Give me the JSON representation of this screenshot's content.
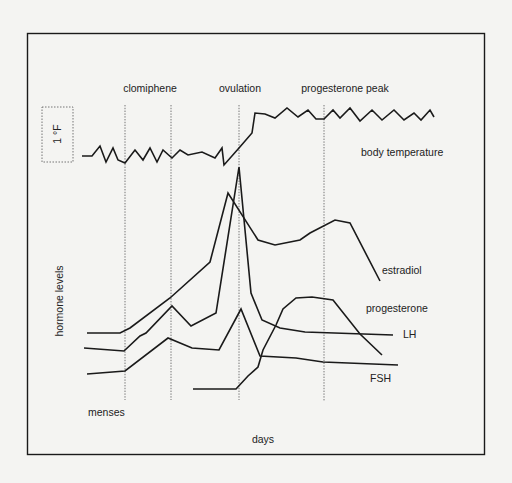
{
  "figure": {
    "title": "",
    "x_axis_label": "days",
    "y_axis_label": "hormone levels",
    "start_marker_label": "menses",
    "temperature_scale_label": "1 °F",
    "events": [
      {
        "label": "clomiphene",
        "lines_x": [
          125,
          172
        ]
      },
      {
        "label": "ovulation",
        "lines_x": [
          239
        ]
      },
      {
        "label": "progesterone peak",
        "lines_x": [
          324
        ]
      }
    ],
    "series_labels": {
      "body_temperature": "body temperature",
      "estradiol": "estradiol",
      "progesterone": "progesterone",
      "lh": "LH",
      "fsh": "FSH"
    },
    "colors": {
      "background": "#f4f4f2",
      "line": "#1a1a1a",
      "dashed": "#555555"
    }
  },
  "chart_data": {
    "type": "line",
    "title": "",
    "xlabel": "days",
    "ylabel": "hormone levels",
    "grid": false,
    "legend_position": "inline labels at right end of each curve",
    "annotations": [
      "clomiphene",
      "ovulation",
      "progesterone peak",
      "menses",
      "1 °F",
      "body temperature"
    ],
    "note": "Schematic, unitless curves; points given in image pixel coordinates (x right, y down).",
    "series": [
      {
        "name": "body temperature",
        "points": [
          [
            82,
            156
          ],
          [
            92,
            156
          ],
          [
            100,
            146
          ],
          [
            106,
            162
          ],
          [
            113,
            148
          ],
          [
            118,
            160
          ],
          [
            125,
            163
          ],
          [
            135,
            150
          ],
          [
            143,
            160
          ],
          [
            150,
            148
          ],
          [
            157,
            162
          ],
          [
            163,
            150
          ],
          [
            172,
            158
          ],
          [
            180,
            150
          ],
          [
            188,
            155
          ],
          [
            202,
            152
          ],
          [
            215,
            158
          ],
          [
            222,
            148
          ],
          [
            224,
            165
          ],
          [
            239,
            148
          ],
          [
            252,
            133
          ],
          [
            255,
            113
          ],
          [
            265,
            114
          ],
          [
            275,
            118
          ],
          [
            287,
            108
          ],
          [
            298,
            117
          ],
          [
            308,
            110
          ],
          [
            316,
            119
          ],
          [
            324,
            119
          ],
          [
            333,
            110
          ],
          [
            340,
            118
          ],
          [
            350,
            108
          ],
          [
            360,
            121
          ],
          [
            372,
            110
          ],
          [
            382,
            120
          ],
          [
            394,
            110
          ],
          [
            404,
            120
          ],
          [
            414,
            113
          ],
          [
            421,
            120
          ],
          [
            430,
            110
          ],
          [
            434,
            117
          ]
        ]
      },
      {
        "name": "estradiol",
        "points": [
          [
            87,
            333
          ],
          [
            120,
            333
          ],
          [
            130,
            328
          ],
          [
            170,
            298
          ],
          [
            210,
            262
          ],
          [
            228,
            193
          ],
          [
            258,
            240
          ],
          [
            275,
            245
          ],
          [
            300,
            240
          ],
          [
            310,
            233
          ],
          [
            335,
            220
          ],
          [
            350,
            223
          ],
          [
            380,
            281
          ]
        ]
      },
      {
        "name": "LH",
        "points": [
          [
            84,
            348
          ],
          [
            124,
            351
          ],
          [
            140,
            336
          ],
          [
            146,
            333
          ],
          [
            172,
            306
          ],
          [
            191,
            326
          ],
          [
            216,
            313
          ],
          [
            239,
            167
          ],
          [
            251,
            293
          ],
          [
            262,
            320
          ],
          [
            280,
            328
          ],
          [
            305,
            332
          ],
          [
            393,
            335
          ]
        ]
      },
      {
        "name": "FSH",
        "points": [
          [
            87,
            374
          ],
          [
            125,
            371
          ],
          [
            168,
            338
          ],
          [
            192,
            348
          ],
          [
            219,
            350
          ],
          [
            241,
            309
          ],
          [
            260,
            356
          ],
          [
            296,
            358
          ],
          [
            323,
            362
          ],
          [
            398,
            365
          ]
        ]
      },
      {
        "name": "progesterone",
        "points": [
          [
            193,
            389
          ],
          [
            236,
            389
          ],
          [
            248,
            376
          ],
          [
            258,
            367
          ],
          [
            263,
            350
          ],
          [
            276,
            325
          ],
          [
            283,
            309
          ],
          [
            296,
            298
          ],
          [
            312,
            297
          ],
          [
            333,
            300
          ],
          [
            360,
            334
          ],
          [
            382,
            355
          ]
        ]
      }
    ],
    "vertical_reference_lines_x": [
      125,
      172,
      239,
      324
    ]
  }
}
